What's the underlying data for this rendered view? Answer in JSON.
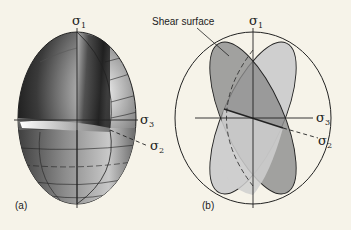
{
  "figure": {
    "panel_a": {
      "label": "(a)",
      "axes": {
        "sigma1": "σ",
        "sigma1_sub": "1",
        "sigma3": "σ",
        "sigma3_sub": "3",
        "sigma2": "σ",
        "sigma2_sub": "2"
      },
      "description": "Strain ellipsoid with one octant cut away"
    },
    "panel_b": {
      "label": "(b)",
      "annotation": "Shear surface",
      "axes": {
        "sigma1": "σ",
        "sigma1_sub": "1",
        "sigma3": "σ",
        "sigma3_sub": "3",
        "sigma2": "σ",
        "sigma2_sub": "2"
      },
      "description": "Ellipsoid with two conjugate shear surfaces"
    },
    "colors": {
      "background": "#f6f3e9",
      "line": "#222222",
      "dark_plane": "#8a8a8a",
      "light_plane": "#cfcfcf",
      "overlap": "#9c9c9c"
    }
  }
}
